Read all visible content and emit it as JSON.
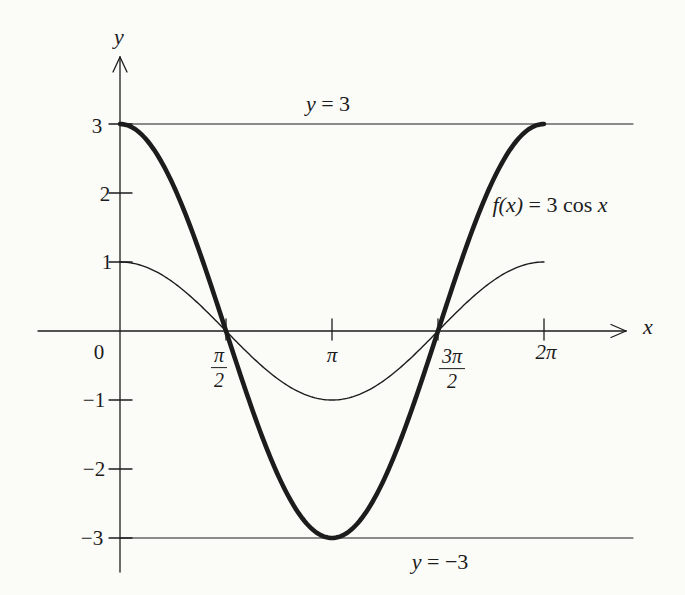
{
  "figure": {
    "background": "#fbfbf8",
    "ink": "#1c1c1c"
  },
  "labels": {
    "upper_line": {
      "var": "y",
      "rest": "= 3"
    },
    "lower_line": {
      "var": "y",
      "rest": "= −3"
    },
    "curve": {
      "lhs": "f(x)",
      "mid": "= 3 cos",
      "var": "x"
    }
  },
  "chart_data": {
    "type": "line",
    "title": "",
    "xlabel": "x",
    "ylabel": "y",
    "origin_label": "0",
    "x_range_pi": [
      0,
      2
    ],
    "xlim_pi": [
      -0.39,
      2.4
    ],
    "ylim": [
      -3.5,
      4
    ],
    "grid": false,
    "x_ticks": [
      {
        "value_pi": 0.5,
        "numerator": "π",
        "denominator": "2"
      },
      {
        "value_pi": 1,
        "label": "π"
      },
      {
        "value_pi": 1.5,
        "numerator": "3π",
        "denominator": "2"
      },
      {
        "value_pi": 2,
        "label": "2π"
      }
    ],
    "y_ticks": [
      {
        "value": 3,
        "label": "3"
      },
      {
        "value": 2,
        "label": "2"
      },
      {
        "value": 1,
        "label": "1"
      },
      {
        "value": -1,
        "label": "−1"
      },
      {
        "value": -2,
        "label": "−2"
      },
      {
        "value": -3,
        "label": "−3"
      }
    ],
    "series": [
      {
        "name": "f(x) = 3 cos x",
        "amplitude": 3,
        "weight": "thick",
        "x_pi": [
          0,
          0.25,
          0.5,
          0.75,
          1,
          1.25,
          1.5,
          1.75,
          2
        ],
        "y": [
          3,
          2.12,
          0,
          -2.12,
          -3,
          -2.12,
          0,
          2.12,
          3
        ]
      },
      {
        "name": "cos x",
        "amplitude": 1,
        "weight": "thin",
        "x_pi": [
          0,
          0.25,
          0.5,
          0.75,
          1,
          1.25,
          1.5,
          1.75,
          2
        ],
        "y": [
          1,
          0.71,
          0,
          -0.71,
          -1,
          -0.71,
          0,
          0.71,
          1
        ]
      }
    ],
    "reference_lines": [
      {
        "y": 3,
        "label": "y = 3"
      },
      {
        "y": -3,
        "label": "y = −3"
      }
    ],
    "legend": "none"
  }
}
